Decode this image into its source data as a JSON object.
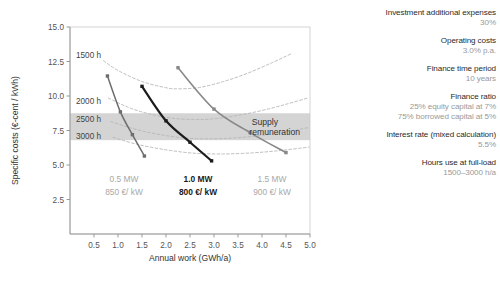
{
  "chart_data": {
    "type": "line",
    "title": "",
    "xlabel": "Annual work (GWh/a)",
    "ylabel": "Specific costs (€-cent / kWh)",
    "xlim": [
      0,
      5.0
    ],
    "ylim": [
      0,
      15.0
    ],
    "xticks": [
      0.5,
      1.0,
      1.5,
      2.0,
      2.5,
      3.0,
      3.5,
      4.0,
      4.5,
      5.0
    ],
    "xtick_labels": [
      "0.5",
      "1.0",
      "1.5",
      "2.0",
      "2.5",
      "3.0",
      "3.5",
      "4.0",
      "4.5",
      "5.0"
    ],
    "yticks": [
      2.5,
      5.0,
      7.5,
      10.0,
      12.5,
      15.0
    ],
    "ytick_labels": [
      "2.5",
      "5.0",
      "7.5",
      "10.0",
      "12.5",
      "15.0"
    ],
    "grid": false,
    "legend_position": "none",
    "band": {
      "label_line1": "Supply",
      "label_line2": "remuneration",
      "y_low": 6.8,
      "y_high": 8.75,
      "color": "#cdcdcd"
    },
    "iso_curves": [
      {
        "name": "1500 h",
        "label": "1500 h",
        "style": "dashed",
        "color": "#b5b5b5",
        "x": [
          0.7,
          1.0,
          1.5,
          2.0,
          2.25,
          2.7,
          3.2,
          3.7,
          4.2,
          4.6
        ],
        "y": [
          12.55,
          11.85,
          11.05,
          10.6,
          10.52,
          10.62,
          11.05,
          11.65,
          12.4,
          13.05
        ]
      },
      {
        "name": "2000 h",
        "label": "2000 h",
        "style": "dashed",
        "color": "#b5b5b5",
        "x": [
          0.8,
          1.2,
          1.6,
          2.1,
          2.6,
          3.0,
          3.5,
          4.0,
          4.5,
          4.95
        ],
        "y": [
          9.85,
          9.2,
          8.75,
          8.4,
          8.3,
          8.35,
          8.6,
          8.95,
          9.4,
          9.85
        ]
      },
      {
        "name": "2500 h",
        "label": "2500 h",
        "style": "dashed",
        "color": "#b5b5b5",
        "x": [
          0.85,
          1.3,
          1.8,
          2.4,
          3.0,
          3.5,
          4.0,
          4.5,
          4.95
        ],
        "y": [
          8.15,
          7.65,
          7.25,
          6.95,
          6.9,
          6.98,
          7.15,
          7.4,
          7.7
        ]
      },
      {
        "name": "3000 h",
        "label": "3000 h",
        "style": "dashed",
        "color": "#b5b5b5",
        "x": [
          0.9,
          1.4,
          2.0,
          2.6,
          3.2,
          3.8,
          4.3,
          4.8,
          4.98
        ],
        "y": [
          7.0,
          6.5,
          6.1,
          5.85,
          5.8,
          5.88,
          6.02,
          6.22,
          6.3
        ]
      }
    ],
    "plant_curves": [
      {
        "name": "0.5 MW",
        "power_label": "0.5 MW",
        "cost_label": "850 €/ kW",
        "emphasis": "dim",
        "color": "#6e6e6e",
        "width": 1.5,
        "points": [
          {
            "x": 0.78,
            "y": 11.45,
            "hours": 1500
          },
          {
            "x": 1.05,
            "y": 8.85,
            "hours": 2000
          },
          {
            "x": 1.3,
            "y": 7.2,
            "hours": 2500
          },
          {
            "x": 1.55,
            "y": 5.65,
            "hours": 3000
          }
        ]
      },
      {
        "name": "1.0 MW",
        "power_label": "1.0 MW",
        "cost_label": "800 €/ kW",
        "emphasis": "dark",
        "color": "#1c1c1c",
        "width": 2.2,
        "points": [
          {
            "x": 1.5,
            "y": 10.7,
            "hours": 1500
          },
          {
            "x": 2.0,
            "y": 8.2,
            "hours": 2000
          },
          {
            "x": 2.5,
            "y": 6.65,
            "hours": 2500
          },
          {
            "x": 2.95,
            "y": 5.3,
            "hours": 3000
          }
        ]
      },
      {
        "name": "1.5 MW",
        "power_label": "1.5 MW",
        "cost_label": "900 €/ kW",
        "emphasis": "dim",
        "color": "#888888",
        "width": 1.6,
        "points": [
          {
            "x": 2.25,
            "y": 12.05,
            "hours": 1500
          },
          {
            "x": 3.0,
            "y": 9.05,
            "hours": 2000
          },
          {
            "x": 3.75,
            "y": 7.35,
            "hours": 2500
          },
          {
            "x": 4.5,
            "y": 5.9,
            "hours": 3000
          }
        ]
      }
    ]
  },
  "params": [
    {
      "name": "Investment additional expenses",
      "value": "30%"
    },
    {
      "name": "Operating costs",
      "value": "3.0% p.a."
    },
    {
      "name": "Finance time period",
      "value": "10 years"
    },
    {
      "name": "Finance ratio",
      "value": "25% equity capital at 7%",
      "value2": "75% borrowed capital at 5%"
    },
    {
      "name": "Interest rate (mixed calculation)",
      "value": "5.5%"
    },
    {
      "name": "Hours use at full-load",
      "value": "1500–3000 h/a"
    }
  ]
}
